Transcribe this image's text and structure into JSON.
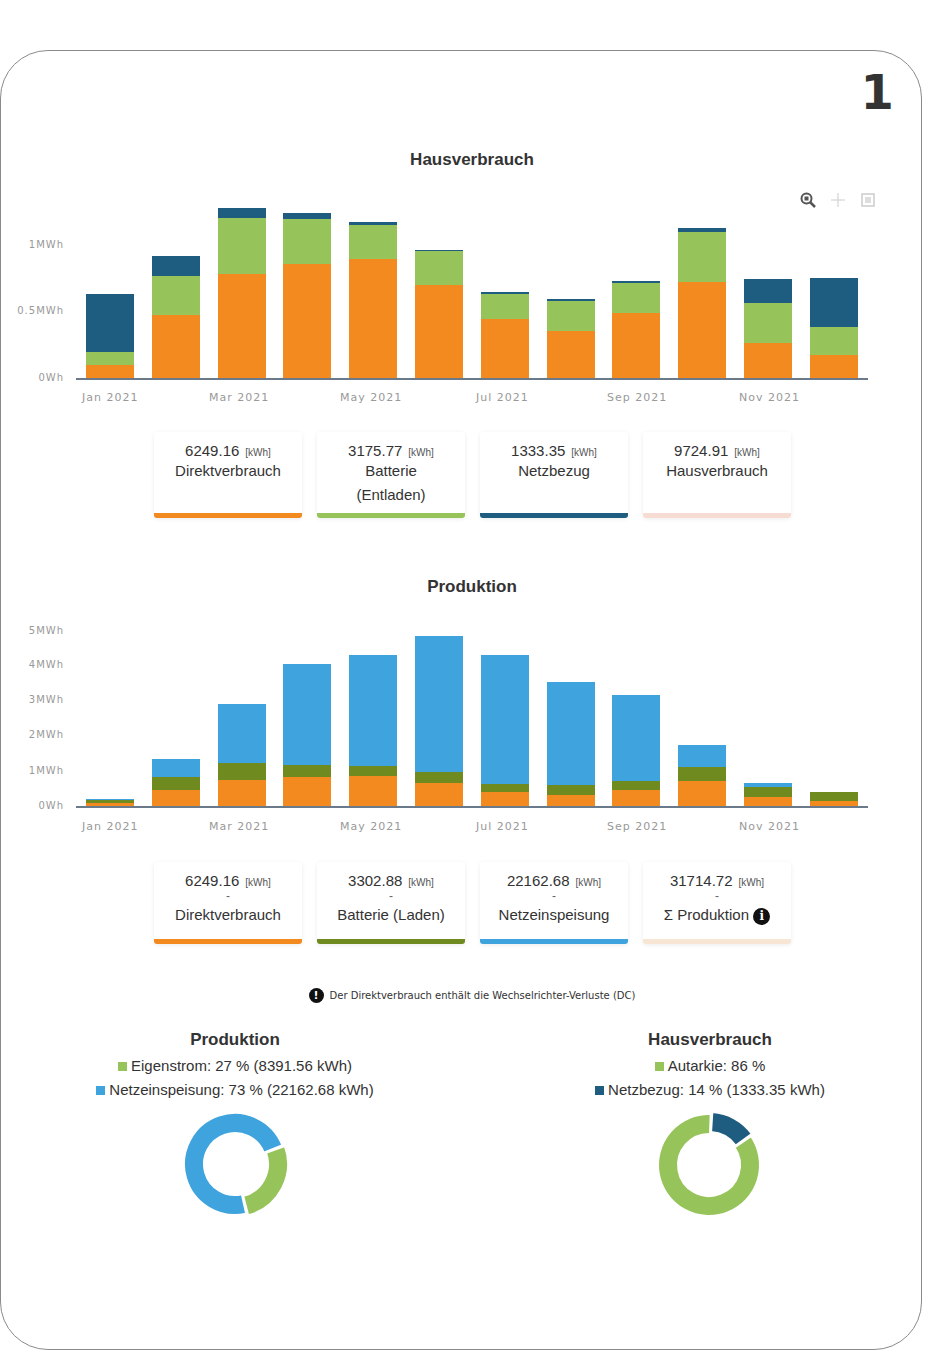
{
  "page_number": "1",
  "colors": {
    "direktverbrauch": "#f28a20",
    "batterie_entladen": "#97c45a",
    "netzbezug": "#1f5d80",
    "batterie_laden": "#6f8a1f",
    "netzeinspeisung": "#3fa3dd",
    "hausverbrauch_strip": "#f6dcd2",
    "produktion_strip": "#f7e6d4"
  },
  "toolbar": {
    "zoom_label": "zoom",
    "pan_label": "pan",
    "reset_label": "reset"
  },
  "hausverbrauch": {
    "title": "Hausverbrauch",
    "y_ticks": [
      "1MWh",
      "0.5MWh",
      "0Wh"
    ],
    "x_ticks": [
      "Jan 2021",
      "Mar 2021",
      "May 2021",
      "Jul 2021",
      "Sep 2021",
      "Nov 2021"
    ],
    "cards": [
      {
        "value": "6249.16",
        "unit": "[kWh]",
        "label": "Direktverbrauch",
        "label2": ""
      },
      {
        "value": "3175.77",
        "unit": "[kWh]",
        "label": "Batterie",
        "label2": "(Entladen)"
      },
      {
        "value": "1333.35",
        "unit": "[kWh]",
        "label": "Netzbezug",
        "label2": ""
      },
      {
        "value": "9724.91",
        "unit": "[kWh]",
        "label": "Hausverbrauch",
        "label2": ""
      }
    ]
  },
  "produktion": {
    "title": "Produktion",
    "y_ticks": [
      "5MWh",
      "4MWh",
      "3MWh",
      "2MWh",
      "1MWh",
      "0Wh"
    ],
    "x_ticks": [
      "Jan 2021",
      "Mar 2021",
      "May 2021",
      "Jul 2021",
      "Sep 2021",
      "Nov 2021"
    ],
    "cards": [
      {
        "value": "6249.16",
        "unit": "[kWh]",
        "dash": "-",
        "label": "Direktverbrauch"
      },
      {
        "value": "3302.88",
        "unit": "[kWh]",
        "dash": "-",
        "label": "Batterie (Laden)"
      },
      {
        "value": "22162.68",
        "unit": "[kWh]",
        "dash": "-",
        "label": "Netzeinspeisung"
      },
      {
        "value": "31714.72",
        "unit": "[kWh]",
        "dash": "-",
        "label": "Σ Produktion"
      }
    ]
  },
  "note": {
    "text": "Der Direktverbrauch enthält die Wechselrichter-Verluste (DC)"
  },
  "donut_produktion": {
    "title": "Produktion",
    "legend": [
      {
        "text": "Eigenstrom: 27 % (8391.56 kWh)"
      },
      {
        "text": "Netzeinspeisung: 73 % (22162.68 kWh)"
      }
    ]
  },
  "donut_hausverbrauch": {
    "title": "Hausverbrauch",
    "legend": [
      {
        "text": "Autarkie: 86 %"
      },
      {
        "text": "Netzbezug: 14 % (1333.35 kWh)"
      }
    ]
  },
  "chart_data": [
    {
      "type": "bar",
      "stacked": true,
      "title": "Hausverbrauch",
      "xlabel": "",
      "ylabel": "",
      "unit": "MWh",
      "ylim": [
        0,
        1.3
      ],
      "y_ticks": [
        "0Wh",
        "0.5MWh",
        "1MWh"
      ],
      "grid": false,
      "categories": [
        "Jan 2021",
        "Feb 2021",
        "Mar 2021",
        "Apr 2021",
        "May 2021",
        "Jun 2021",
        "Jul 2021",
        "Aug 2021",
        "Sep 2021",
        "Oct 2021",
        "Nov 2021",
        "Dec 2021"
      ],
      "series": [
        {
          "name": "Direktverbrauch",
          "color": "#f28a20",
          "values": [
            0.1,
            0.47,
            0.78,
            0.86,
            0.895,
            0.7,
            0.44,
            0.35,
            0.49,
            0.72,
            0.265,
            0.175
          ]
        },
        {
          "name": "Batterie (Entladen)",
          "color": "#97c45a",
          "values": [
            0.095,
            0.3,
            0.42,
            0.335,
            0.255,
            0.255,
            0.19,
            0.23,
            0.225,
            0.38,
            0.3,
            0.21
          ]
        },
        {
          "name": "Netzbezug",
          "color": "#1f5d80",
          "values": [
            0.435,
            0.15,
            0.08,
            0.045,
            0.02,
            0.01,
            0.015,
            0.015,
            0.015,
            0.03,
            0.18,
            0.365
          ]
        }
      ],
      "totals_kwh": {
        "Direktverbrauch": 6249.16,
        "Batterie (Entladen)": 3175.77,
        "Netzbezug": 1333.35,
        "Hausverbrauch": 9724.91
      }
    },
    {
      "type": "bar",
      "stacked": true,
      "title": "Produktion",
      "xlabel": "",
      "ylabel": "",
      "unit": "MWh",
      "ylim": [
        0,
        5
      ],
      "y_ticks": [
        "0Wh",
        "1MWh",
        "2MWh",
        "3MWh",
        "4MWh",
        "5MWh"
      ],
      "grid": false,
      "categories": [
        "Jan 2021",
        "Feb 2021",
        "Mar 2021",
        "Apr 2021",
        "May 2021",
        "Jun 2021",
        "Jul 2021",
        "Aug 2021",
        "Sep 2021",
        "Oct 2021",
        "Nov 2021",
        "Dec 2021"
      ],
      "series": [
        {
          "name": "Direktverbrauch",
          "color": "#f28a20",
          "values": [
            0.1,
            0.47,
            0.74,
            0.83,
            0.86,
            0.66,
            0.4,
            0.31,
            0.46,
            0.71,
            0.26,
            0.14
          ]
        },
        {
          "name": "Batterie (Laden)",
          "color": "#6f8a1f",
          "values": [
            0.07,
            0.36,
            0.49,
            0.34,
            0.28,
            0.31,
            0.23,
            0.29,
            0.25,
            0.4,
            0.28,
            0.26
          ]
        },
        {
          "name": "Netzeinspeisung",
          "color": "#3fa3dd",
          "values": [
            0.03,
            0.51,
            1.68,
            2.89,
            3.17,
            3.89,
            3.68,
            2.94,
            2.46,
            0.63,
            0.12,
            0.0
          ]
        }
      ],
      "totals_kwh": {
        "Direktverbrauch": 6249.16,
        "Batterie (Laden)": 3302.88,
        "Netzeinspeisung": 22162.68,
        "Σ Produktion": 31714.72
      }
    },
    {
      "type": "pie",
      "donut": true,
      "title": "Produktion",
      "categories": [
        "Eigenstrom",
        "Netzeinspeisung"
      ],
      "values": [
        27,
        73
      ],
      "kwh": [
        8391.56,
        22162.68
      ],
      "colors": [
        "#97c45a",
        "#3fa3dd"
      ]
    },
    {
      "type": "pie",
      "donut": true,
      "title": "Hausverbrauch",
      "categories": [
        "Autarkie",
        "Netzbezug"
      ],
      "values": [
        86,
        14
      ],
      "kwh": [
        null,
        1333.35
      ],
      "colors": [
        "#97c45a",
        "#1f5d80"
      ]
    }
  ]
}
